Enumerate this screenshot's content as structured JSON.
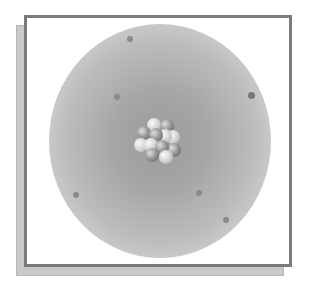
{
  "diagram": {
    "components": {
      "frame": "bordered panel with drop shadow",
      "electron_cloud": "gray radial gradient sphere",
      "nucleus": "cluster of protons and neutrons",
      "electrons": 8
    },
    "colors": {
      "frame_border": "#7a7a7a",
      "shadow": "#c9c9c9",
      "cloud_center": "#9a9a9a",
      "cloud_edge": "#ececec",
      "electron": "#8a8a8a"
    },
    "electrons": [
      {
        "x": 130,
        "y": 39
      },
      {
        "x": 117,
        "y": 97
      },
      {
        "x": 251,
        "y": 95
      },
      {
        "x": 227,
        "y": 58
      },
      {
        "x": 76,
        "y": 195
      },
      {
        "x": 199,
        "y": 193
      },
      {
        "x": 226,
        "y": 220
      }
    ]
  }
}
